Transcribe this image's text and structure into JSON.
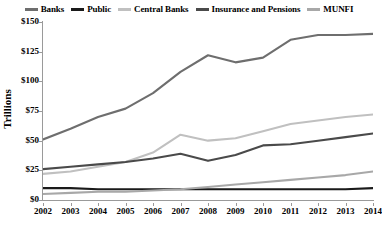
{
  "chart_data": {
    "type": "line",
    "title": "",
    "xlabel": "",
    "ylabel": "Trillions",
    "x": [
      2002,
      2003,
      2004,
      2005,
      2006,
      2007,
      2008,
      2009,
      2010,
      2011,
      2012,
      2013,
      2014
    ],
    "categories": [
      "2002",
      "2003",
      "2004",
      "2005",
      "2006",
      "2007",
      "2008",
      "2009",
      "2010",
      "2011",
      "2012",
      "2013",
      "2014"
    ],
    "xlim": [
      2002,
      2014
    ],
    "ylim": [
      0,
      150
    ],
    "ytick_labels": [
      "$0",
      "$25",
      "$50",
      "$75",
      "$100",
      "$125",
      "$150"
    ],
    "ytick_values": [
      0,
      25,
      50,
      75,
      100,
      125,
      150
    ],
    "grid": false,
    "legend_position": "top",
    "series": [
      {
        "name": "Banks",
        "color": "#6e6e6e",
        "values": [
          51,
          60,
          70,
          77,
          90,
          108,
          122,
          116,
          120,
          135,
          139,
          139,
          140
        ]
      },
      {
        "name": "Public",
        "color": "#1a1a1a",
        "values": [
          10,
          10,
          9,
          9,
          9,
          9,
          9,
          9,
          9,
          9,
          9,
          9,
          10
        ]
      },
      {
        "name": "Central Banks",
        "color": "#c0c0c0",
        "values": [
          22,
          24,
          28,
          32,
          40,
          55,
          50,
          52,
          58,
          64,
          67,
          70,
          72
        ]
      },
      {
        "name": "Insurance and Pensions",
        "color": "#4a4a4a",
        "values": [
          26,
          28,
          30,
          32,
          35,
          39,
          33,
          38,
          46,
          47,
          50,
          53,
          56
        ]
      },
      {
        "name": "MUNFI",
        "color": "#a8a8a8",
        "values": [
          5,
          6,
          7,
          7,
          8,
          9,
          11,
          13,
          15,
          17,
          19,
          21,
          24
        ]
      }
    ]
  }
}
